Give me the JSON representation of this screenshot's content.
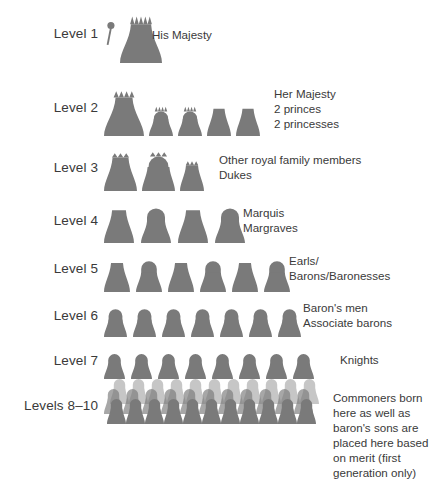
{
  "diagram": {
    "figure_color": "#7a7a7a",
    "text_color": "#3a3a3a",
    "background": "#ffffff",
    "levels": [
      {
        "id": "level-1",
        "label": "Level 1",
        "description": "His Majesty",
        "figure_count": 1,
        "figures": [
          {
            "type": "king-with-scepter",
            "width": 42,
            "height": 56,
            "crown_points": 5,
            "scepter": true
          }
        ]
      },
      {
        "id": "level-2",
        "label": "Level 2",
        "description": "Her Majesty\n2 princes\n2 princesses",
        "figure_count": 5,
        "figures": [
          {
            "type": "queen-large",
            "width": 40,
            "height": 47,
            "crown_points": 4,
            "scepter": false
          },
          {
            "type": "crowned-small",
            "width": 24,
            "height": 31,
            "crown_points": 4,
            "scepter": false
          },
          {
            "type": "crowned-small",
            "width": 24,
            "height": 31,
            "crown_points": 4,
            "scepter": false
          },
          {
            "type": "plain-small",
            "width": 24,
            "height": 30,
            "crown_points": 0,
            "scepter": false
          },
          {
            "type": "plain-small",
            "width": 24,
            "height": 30,
            "crown_points": 0,
            "scepter": false
          }
        ]
      },
      {
        "id": "level-3",
        "label": "Level 3",
        "description": "Other royal family members\nDukes",
        "figure_count": 3,
        "figures": [
          {
            "type": "tufted-tall",
            "width": 33,
            "height": 39,
            "crown_points": 3,
            "scepter": false
          },
          {
            "type": "tufted-head",
            "width": 33,
            "height": 40,
            "crown_points": 3,
            "scepter": false
          },
          {
            "type": "tufted-short",
            "width": 24,
            "height": 31,
            "crown_points": 3,
            "scepter": false
          }
        ]
      },
      {
        "id": "level-4",
        "label": "Level 4",
        "description": "Marquis\nMargraves",
        "figure_count": 4,
        "figures": [
          {
            "type": "plain",
            "width": 30,
            "height": 36,
            "crown_points": 0,
            "scepter": false
          },
          {
            "type": "headed",
            "width": 30,
            "height": 36,
            "crown_points": 0,
            "scepter": false
          },
          {
            "type": "plain",
            "width": 30,
            "height": 36,
            "crown_points": 0,
            "scepter": false
          },
          {
            "type": "headed",
            "width": 30,
            "height": 36,
            "crown_points": 0,
            "scepter": false
          }
        ]
      },
      {
        "id": "level-5",
        "label": "Level 5",
        "description": "Earls/\nBarons/Baronesses",
        "figure_count": 6,
        "figures": [
          {
            "type": "plain",
            "width": 26,
            "height": 32,
            "crown_points": 0,
            "scepter": false
          },
          {
            "type": "headed",
            "width": 26,
            "height": 32,
            "crown_points": 0,
            "scepter": false
          },
          {
            "type": "plain",
            "width": 26,
            "height": 32,
            "crown_points": 0,
            "scepter": false
          },
          {
            "type": "headed",
            "width": 26,
            "height": 32,
            "crown_points": 0,
            "scepter": false
          },
          {
            "type": "plain",
            "width": 26,
            "height": 32,
            "crown_points": 0,
            "scepter": false
          },
          {
            "type": "headed",
            "width": 26,
            "height": 32,
            "crown_points": 0,
            "scepter": false
          }
        ]
      },
      {
        "id": "level-6",
        "label": "Level 6",
        "description": "Baron's men\nAssociate barons",
        "figure_count": 7,
        "figures": [
          {
            "type": "headed",
            "width": 23,
            "height": 29,
            "crown_points": 0,
            "scepter": false
          },
          {
            "type": "headed",
            "width": 23,
            "height": 29,
            "crown_points": 0,
            "scepter": false
          },
          {
            "type": "headed",
            "width": 23,
            "height": 29,
            "crown_points": 0,
            "scepter": false
          },
          {
            "type": "headed",
            "width": 23,
            "height": 29,
            "crown_points": 0,
            "scepter": false
          },
          {
            "type": "headed",
            "width": 23,
            "height": 29,
            "crown_points": 0,
            "scepter": false
          },
          {
            "type": "headed",
            "width": 23,
            "height": 29,
            "crown_points": 0,
            "scepter": false
          },
          {
            "type": "headed",
            "width": 23,
            "height": 29,
            "crown_points": 0,
            "scepter": false
          }
        ]
      },
      {
        "id": "level-7",
        "label": "Level 7",
        "description": "Knights",
        "figure_count": 8,
        "figures": [
          {
            "type": "headed",
            "width": 21,
            "height": 26,
            "crown_points": 0,
            "scepter": false
          },
          {
            "type": "headed",
            "width": 21,
            "height": 26,
            "crown_points": 0,
            "scepter": false
          },
          {
            "type": "headed",
            "width": 21,
            "height": 26,
            "crown_points": 0,
            "scepter": false
          },
          {
            "type": "headed",
            "width": 21,
            "height": 26,
            "crown_points": 0,
            "scepter": false
          },
          {
            "type": "headed",
            "width": 21,
            "height": 26,
            "crown_points": 0,
            "scepter": false
          },
          {
            "type": "headed",
            "width": 21,
            "height": 26,
            "crown_points": 0,
            "scepter": false
          },
          {
            "type": "headed",
            "width": 21,
            "height": 26,
            "crown_points": 0,
            "scepter": false
          },
          {
            "type": "headed",
            "width": 21,
            "height": 26,
            "crown_points": 0,
            "scepter": false
          }
        ]
      },
      {
        "id": "levels-8-10",
        "label": "Levels 8–10",
        "description": "Commoners born\nhere as well as\nbaron's sons are\nplaced here based\non merit (first\ngeneration only)",
        "figure_count": 33,
        "crowd": {
          "rows": [
            {
              "name": "back-row",
              "count": 11,
              "opacity": 0.42
            },
            {
              "name": "mid-row",
              "count": 11,
              "opacity": 0.66
            },
            {
              "name": "front-row",
              "count": 11,
              "opacity": 1.0
            }
          ],
          "figure_width": 19,
          "figure_height": 26
        }
      }
    ]
  }
}
